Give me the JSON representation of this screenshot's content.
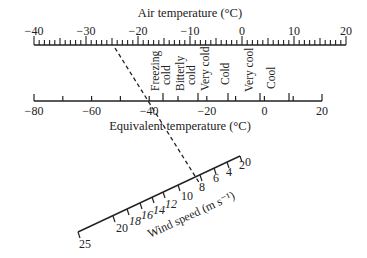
{
  "air_scale": {
    "title": "Air temperature (°C)",
    "min": -40,
    "max": 20,
    "major_labels": [
      "−40",
      "−30",
      "−20",
      "−10",
      "0",
      "10",
      "20"
    ],
    "major_values": [
      -40,
      -30,
      -20,
      -10,
      0,
      10,
      20
    ]
  },
  "equivalent_scale": {
    "title": "Equivalent temperature (°C)",
    "min": -80,
    "max": 20,
    "major_labels": [
      "−80",
      "−60",
      "−40",
      "−20",
      "0",
      "20"
    ],
    "major_values": [
      -80,
      -60,
      -40,
      -20,
      0,
      20
    ],
    "zones": [
      {
        "label_line1": "Freezing",
        "label_line2": "cold"
      },
      {
        "label_line1": "Bitterly",
        "label_line2": "cold"
      },
      {
        "label_line1": "Very cold",
        "label_line2": ""
      },
      {
        "label_line1": "Cold",
        "label_line2": ""
      },
      {
        "label_line1": "Very cool",
        "label_line2": ""
      },
      {
        "label_line1": "Cool",
        "label_line2": ""
      }
    ]
  },
  "wind_scale": {
    "title": "Wind speed (m s⁻¹)",
    "labels": [
      "25",
      "20",
      "18",
      "16",
      "14",
      "12",
      "10",
      "8",
      "6",
      "4",
      "2",
      "0"
    ]
  },
  "example_line": {
    "style": "dashed",
    "from_air": -22,
    "to_wind": 8
  }
}
